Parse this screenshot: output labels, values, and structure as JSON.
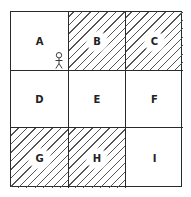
{
  "diagram": {
    "type": "3x3 grid",
    "cells": [
      {
        "id": "A",
        "label": "A",
        "hatched": false,
        "has_figure": true
      },
      {
        "id": "B",
        "label": "B",
        "hatched": true,
        "has_figure": false
      },
      {
        "id": "C",
        "label": "C",
        "hatched": true,
        "has_figure": false
      },
      {
        "id": "D",
        "label": "D",
        "hatched": false,
        "has_figure": false
      },
      {
        "id": "E",
        "label": "E",
        "hatched": false,
        "has_figure": false
      },
      {
        "id": "F",
        "label": "F",
        "hatched": false,
        "has_figure": false
      },
      {
        "id": "G",
        "label": "G",
        "hatched": true,
        "has_figure": false
      },
      {
        "id": "H",
        "label": "H",
        "hatched": true,
        "has_figure": false
      },
      {
        "id": "I",
        "label": "I",
        "hatched": false,
        "has_figure": false
      }
    ],
    "figure": {
      "icon": "stick-figure-icon",
      "location_cell": "A",
      "position": "bottom-right corner"
    },
    "colors": {
      "line": "#2a2a2a",
      "hatch": "#555555",
      "background": "#ffffff"
    }
  }
}
